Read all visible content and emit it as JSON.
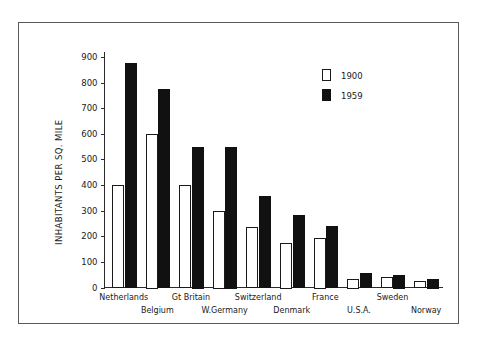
{
  "chart_data": {
    "type": "bar",
    "title": "",
    "subtitle": "",
    "xlabel": "",
    "ylabel": "INHABITANTS  PER  SQ. MILE",
    "ylim": [
      0,
      900
    ],
    "ytick_values": [
      0,
      100,
      200,
      300,
      400,
      500,
      600,
      700,
      800,
      900
    ],
    "ytick_labels": [
      "0",
      "100",
      "200",
      "300",
      "400",
      "500",
      "600",
      "700",
      "800",
      "900"
    ],
    "grid": false,
    "legend_position": "top-right",
    "categories": [
      "Netherlands",
      "Belgium",
      "Gt Britain",
      "W.Germany",
      "Switzerland",
      "Denmark",
      "France",
      "U.S.A.",
      "Sweden",
      "Norway"
    ],
    "category_rows": [
      {
        "label": "Netherlands",
        "row": "top"
      },
      {
        "label": "Belgium",
        "row": "bottom"
      },
      {
        "label": "Gt Britain",
        "row": "top"
      },
      {
        "label": "W.Germany",
        "row": "bottom"
      },
      {
        "label": "Switzerland",
        "row": "top"
      },
      {
        "label": "Denmark",
        "row": "bottom"
      },
      {
        "label": "France",
        "row": "top"
      },
      {
        "label": "U.S.A.",
        "row": "bottom"
      },
      {
        "label": "Sweden",
        "row": "top"
      },
      {
        "label": "Norway",
        "row": "bottom"
      }
    ],
    "series": [
      {
        "name": "1900",
        "style": "open",
        "color": "#ffffff",
        "edge_color": "#1a1a1a",
        "values": [
          400,
          600,
          400,
          300,
          235,
          175,
          195,
          35,
          40,
          25
        ]
      },
      {
        "name": "1959",
        "style": "filled",
        "color": "#111111",
        "edge_color": "#111111",
        "values": [
          875,
          775,
          550,
          550,
          357,
          282,
          240,
          55,
          50,
          35
        ]
      }
    ]
  },
  "legend": {
    "entries": [
      {
        "label": "1900",
        "style": "open"
      },
      {
        "label": "1959",
        "style": "filled"
      }
    ]
  },
  "axis": {
    "y_title": "INHABITANTS  PER  SQ. MILE"
  }
}
